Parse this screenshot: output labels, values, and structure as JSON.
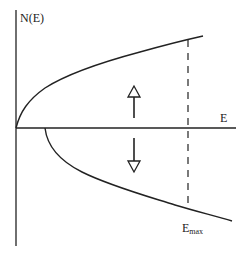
{
  "diagram": {
    "type": "density-of-states",
    "y_axis_label": "N(E)",
    "x_axis_label": "E",
    "marker_label_main": "E",
    "marker_label_sub": "max",
    "upper_curve": "spin-up band (sqrt(E) rising)",
    "lower_curve": "spin-down band (mirrored, shifted)",
    "arrows": [
      {
        "direction": "up",
        "style": "hollow-head"
      },
      {
        "direction": "down",
        "style": "hollow-head"
      }
    ],
    "colors": {
      "ink": "#222222",
      "background": "#ffffff"
    }
  }
}
